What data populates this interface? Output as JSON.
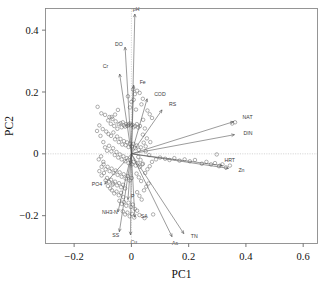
{
  "figure": {
    "kind": "pca-biplot",
    "background": "#ffffff",
    "frame_color": "#8a8a8a",
    "point_color": "#6e6e6e",
    "vector_color": "#4a4a4a"
  },
  "chart_data": {
    "type": "scatter",
    "title": "",
    "subtitle": "",
    "xlabel": "PC1",
    "ylabel": "PC2",
    "xlim": [
      -0.3,
      0.65
    ],
    "ylim": [
      -0.29,
      0.47
    ],
    "xticks": [
      -0.2,
      0.0,
      0.2,
      0.4,
      0.6
    ],
    "xtick_labels": [
      "−0.2",
      "0",
      "0.2",
      "0.4",
      "0.6"
    ],
    "yticks": [
      0.4,
      0.2,
      0.0,
      -0.2
    ],
    "ytick_labels": [
      "0.4",
      "0.2",
      "0",
      "−0.2"
    ],
    "grid": false,
    "zero_lines": true,
    "legend": "none",
    "marker": "open-circle",
    "loadings": [
      {
        "label": "pH",
        "x": 0.012,
        "y": 0.452,
        "label_dx": -2,
        "label_dy": -3
      },
      {
        "label": "DO",
        "x": -0.022,
        "y": 0.345,
        "label_dx": -10,
        "label_dy": -1
      },
      {
        "label": "Cr",
        "x": -0.041,
        "y": 0.258,
        "label_dx": -17,
        "label_dy": -6
      },
      {
        "label": "Fe",
        "x": 0.008,
        "y": 0.222,
        "label_dx": 6,
        "label_dy": -1
      },
      {
        "label": "COD",
        "x": 0.055,
        "y": 0.178,
        "label_dx": 7,
        "label_dy": -3
      },
      {
        "label": "RS",
        "x": 0.107,
        "y": 0.142,
        "label_dx": 7,
        "label_dy": -4
      },
      {
        "label": "NAT",
        "x": 0.357,
        "y": 0.104,
        "label_dx": 9,
        "label_dy": -3
      },
      {
        "label": "DIN",
        "x": 0.36,
        "y": 0.062,
        "label_dx": 9,
        "label_dy": 0
      },
      {
        "label": "HRT",
        "x": 0.318,
        "y": -0.038,
        "label_dx": 2,
        "label_dy": -4
      },
      {
        "label": "Zn",
        "x": 0.339,
        "y": -0.047,
        "label_dx": 10,
        "label_dy": 4
      },
      {
        "label": "TN",
        "x": 0.183,
        "y": -0.258,
        "label_dx": 7,
        "label_dy": 4
      },
      {
        "label": "As",
        "x": 0.142,
        "y": -0.268,
        "label_dx": 0,
        "label_dy": 8
      },
      {
        "label": "SA",
        "x": 0.012,
        "y": -0.205,
        "label_dx": 6,
        "label_dy": 1
      },
      {
        "label": "Cu",
        "x": -0.003,
        "y": -0.262,
        "label_dx": 0,
        "label_dy": 9
      },
      {
        "label": "SS",
        "x": -0.042,
        "y": -0.252,
        "label_dx": -7,
        "label_dy": 5
      },
      {
        "label": "NH3-N",
        "x": -0.047,
        "y": -0.188,
        "label_dx": -16,
        "label_dy": 2
      },
      {
        "label": "P",
        "x": -0.012,
        "y": -0.148,
        "label_dx": 3,
        "label_dy": -2
      },
      {
        "label": "PO4",
        "x": -0.093,
        "y": -0.098,
        "label_dx": -13,
        "label_dy": 2
      }
    ],
    "scores": [
      [
        -0.118,
        0.152
      ],
      [
        -0.105,
        0.131
      ],
      [
        -0.092,
        0.126
      ],
      [
        -0.081,
        0.108
      ],
      [
        -0.072,
        0.097
      ],
      [
        -0.069,
        0.119
      ],
      [
        -0.06,
        0.09
      ],
      [
        -0.055,
        0.105
      ],
      [
        -0.049,
        0.081
      ],
      [
        -0.044,
        0.096
      ],
      [
        -0.038,
        0.099
      ],
      [
        -0.034,
        0.086
      ],
      [
        -0.03,
        0.102
      ],
      [
        -0.026,
        0.092
      ],
      [
        -0.022,
        0.088
      ],
      [
        -0.018,
        0.096
      ],
      [
        -0.014,
        0.09
      ],
      [
        -0.01,
        0.094
      ],
      [
        -0.006,
        0.098
      ],
      [
        -0.002,
        0.092
      ],
      [
        0.003,
        0.094
      ],
      [
        0.008,
        0.086
      ],
      [
        0.013,
        0.09
      ],
      [
        0.019,
        0.096
      ],
      [
        0.024,
        0.085
      ],
      [
        0.03,
        0.09
      ],
      [
        0.041,
        0.11
      ],
      [
        0.047,
        0.082
      ],
      [
        0.012,
        0.193
      ],
      [
        0.02,
        0.204
      ],
      [
        0.029,
        0.197
      ],
      [
        0.008,
        0.175
      ],
      [
        0.0,
        0.168
      ],
      [
        -0.005,
        0.15
      ],
      [
        0.016,
        0.143
      ],
      [
        0.035,
        0.16
      ],
      [
        -0.047,
        0.142
      ],
      [
        -0.057,
        0.127
      ],
      [
        -0.066,
        0.113
      ],
      [
        -0.077,
        0.119
      ],
      [
        -0.088,
        0.072
      ],
      [
        -0.08,
        0.064
      ],
      [
        -0.071,
        0.058
      ],
      [
        -0.063,
        0.069
      ],
      [
        -0.057,
        0.047
      ],
      [
        -0.05,
        0.056
      ],
      [
        -0.044,
        0.038
      ],
      [
        -0.038,
        0.048
      ],
      [
        -0.032,
        0.03
      ],
      [
        -0.026,
        0.041
      ],
      [
        -0.02,
        0.028
      ],
      [
        -0.015,
        0.037
      ],
      [
        -0.01,
        0.022
      ],
      [
        -0.005,
        0.033
      ],
      [
        0.001,
        0.024
      ],
      [
        0.007,
        0.032
      ],
      [
        0.013,
        0.018
      ],
      [
        0.019,
        0.027
      ],
      [
        0.026,
        0.013
      ],
      [
        0.033,
        0.021
      ],
      [
        0.043,
        0.036
      ],
      [
        0.05,
        0.024
      ],
      [
        -0.098,
        0.038
      ],
      [
        -0.092,
        0.021
      ],
      [
        -0.085,
        0.01
      ],
      [
        -0.078,
        0.026
      ],
      [
        -0.07,
        0.008
      ],
      [
        -0.064,
        0.018
      ],
      [
        -0.058,
        -0.004
      ],
      [
        -0.052,
        0.006
      ],
      [
        -0.046,
        -0.012
      ],
      [
        -0.04,
        -0.002
      ],
      [
        -0.034,
        -0.018
      ],
      [
        -0.028,
        -0.008
      ],
      [
        -0.022,
        -0.024
      ],
      [
        -0.016,
        -0.014
      ],
      [
        -0.01,
        -0.03
      ],
      [
        -0.004,
        -0.02
      ],
      [
        0.002,
        -0.034
      ],
      [
        0.008,
        -0.026
      ],
      [
        0.015,
        -0.038
      ],
      [
        0.022,
        -0.03
      ],
      [
        0.03,
        -0.042
      ],
      [
        0.038,
        -0.034
      ],
      [
        -0.104,
        -0.042
      ],
      [
        -0.097,
        -0.034
      ],
      [
        -0.09,
        -0.05
      ],
      [
        -0.083,
        -0.042
      ],
      [
        -0.076,
        -0.056
      ],
      [
        -0.069,
        -0.048
      ],
      [
        -0.062,
        -0.062
      ],
      [
        -0.055,
        -0.054
      ],
      [
        -0.048,
        -0.068
      ],
      [
        -0.041,
        -0.06
      ],
      [
        -0.034,
        -0.074
      ],
      [
        -0.027,
        -0.066
      ],
      [
        -0.02,
        -0.08
      ],
      [
        -0.013,
        -0.072
      ],
      [
        -0.006,
        -0.086
      ],
      [
        0.001,
        -0.078
      ],
      [
        -0.085,
        -0.078
      ],
      [
        -0.078,
        -0.09
      ],
      [
        -0.071,
        -0.084
      ],
      [
        -0.064,
        -0.096
      ],
      [
        -0.057,
        -0.09
      ],
      [
        -0.05,
        -0.102
      ],
      [
        -0.043,
        -0.095
      ],
      [
        -0.036,
        -0.108
      ],
      [
        -0.029,
        -0.1
      ],
      [
        -0.022,
        -0.112
      ],
      [
        -0.068,
        -0.118
      ],
      [
        -0.06,
        -0.128
      ],
      [
        -0.052,
        -0.122
      ],
      [
        -0.044,
        -0.134
      ],
      [
        -0.036,
        -0.126
      ],
      [
        -0.028,
        -0.14
      ],
      [
        -0.042,
        -0.152
      ],
      [
        -0.034,
        -0.162
      ],
      [
        -0.026,
        -0.156
      ],
      [
        -0.018,
        -0.168
      ],
      [
        -0.01,
        -0.158
      ],
      [
        -0.002,
        -0.172
      ],
      [
        0.005,
        -0.164
      ],
      [
        0.012,
        -0.178
      ],
      [
        -0.03,
        -0.186
      ],
      [
        -0.022,
        -0.196
      ],
      [
        -0.014,
        -0.19
      ],
      [
        -0.006,
        -0.202
      ],
      [
        0.002,
        -0.194
      ],
      [
        0.01,
        -0.206
      ],
      [
        0.028,
        -0.198
      ],
      [
        0.02,
        -0.184
      ],
      [
        0.036,
        -0.148
      ],
      [
        0.028,
        -0.136
      ],
      [
        0.02,
        -0.124
      ],
      [
        0.044,
        -0.118
      ],
      [
        0.052,
        -0.106
      ],
      [
        0.06,
        -0.096
      ],
      [
        0.034,
        -0.088
      ],
      [
        0.026,
        -0.076
      ],
      [
        0.018,
        -0.064
      ],
      [
        0.048,
        -0.062
      ],
      [
        0.056,
        -0.05
      ],
      [
        0.064,
        -0.04
      ],
      [
        0.04,
        -0.032
      ],
      [
        0.032,
        -0.02
      ],
      [
        0.024,
        -0.01
      ],
      [
        0.072,
        -0.026
      ],
      [
        0.086,
        -0.018
      ],
      [
        0.1,
        -0.012
      ],
      [
        0.118,
        -0.016
      ],
      [
        0.133,
        -0.02
      ],
      [
        0.15,
        -0.014
      ],
      [
        0.168,
        -0.022
      ],
      [
        0.186,
        -0.018
      ],
      [
        0.204,
        -0.024
      ],
      [
        0.222,
        -0.02
      ],
      [
        0.246,
        -0.032
      ],
      [
        0.262,
        -0.026
      ],
      [
        0.278,
        -0.034
      ],
      [
        0.292,
        -0.03
      ],
      [
        0.306,
        -0.04
      ],
      [
        0.318,
        -0.034
      ],
      [
        0.33,
        -0.044
      ],
      [
        0.344,
        -0.038
      ],
      [
        0.298,
        -0.002
      ],
      [
        0.352,
        0.098
      ],
      [
        0.362,
        0.102
      ],
      [
        0.056,
        0.14
      ],
      [
        0.064,
        0.128
      ],
      [
        0.072,
        0.116
      ],
      [
        0.04,
        0.062
      ],
      [
        0.054,
        0.05
      ],
      [
        0.066,
        0.038
      ],
      [
        0.05,
        0.008
      ],
      [
        0.062,
        -0.004
      ],
      [
        -0.112,
        0.092
      ],
      [
        -0.12,
        0.074
      ],
      [
        -0.108,
        0.058
      ],
      [
        -0.1,
        0.08
      ],
      [
        -0.114,
        -0.018
      ],
      [
        -0.106,
        -0.008
      ],
      [
        -0.098,
        -0.026
      ],
      [
        -0.112,
        -0.056
      ],
      [
        -0.104,
        -0.07
      ],
      [
        -0.096,
        -0.062
      ],
      [
        -0.09,
        -0.086
      ],
      [
        -0.082,
        -0.104
      ],
      [
        -0.074,
        -0.112
      ],
      [
        -0.066,
        -0.1
      ],
      [
        0.076,
        -0.196
      ],
      [
        0.046,
        -0.208
      ],
      [
        0.006,
        0.208
      ],
      [
        -0.012,
        0.186
      ],
      [
        0.04,
        0.178
      ]
    ]
  }
}
